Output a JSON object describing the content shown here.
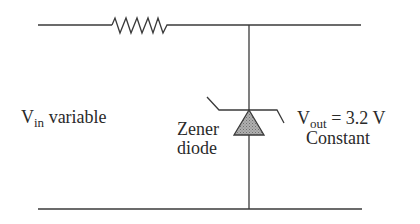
{
  "diagram": {
    "input": {
      "symbol": "V",
      "subscript": "in",
      "description": "variable"
    },
    "component": {
      "line1": "Zener",
      "line2": "diode"
    },
    "output": {
      "symbol": "V",
      "subscript": "out",
      "equation": "= 3.2 V",
      "description": "Constant"
    },
    "elements": [
      "resistor",
      "zener-diode",
      "top-rail",
      "bottom-rail"
    ],
    "colors": {
      "wire": "#3a3a3a",
      "diode_fill": "#9a9a9a",
      "text": "#2a2a2a"
    }
  }
}
